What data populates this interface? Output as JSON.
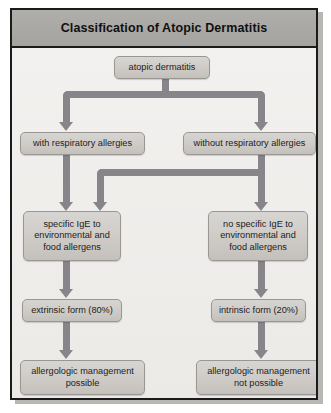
{
  "figure": {
    "title": "Classification of Atopic Dermatitis",
    "colors": {
      "frame_border": "#1b1b1b",
      "titlebar": "#a5a3a0",
      "canvas": "#f0efed",
      "node_fill": "#cecbc7",
      "node_border": "#9a9793",
      "connector": "#87858a"
    }
  },
  "diagram": {
    "type": "flowchart",
    "orientation": "top-down",
    "nodes": [
      {
        "id": "root",
        "label": "atopic dermatitis"
      },
      {
        "id": "with_resp",
        "label": "with respiratory allergies"
      },
      {
        "id": "without_resp",
        "label": "without respiratory allergies"
      },
      {
        "id": "ige_pos",
        "label": "specific IgE to environmental and food allergens"
      },
      {
        "id": "ige_neg",
        "label": "no specific IgE to environmental and food allergens"
      },
      {
        "id": "extrinsic",
        "label": "extrinsic form (80%)"
      },
      {
        "id": "intrinsic",
        "label": "intrinsic form (20%)"
      },
      {
        "id": "mgmt_yes",
        "label": "allergologic management possible"
      },
      {
        "id": "mgmt_no",
        "label": "allergologic management not possible"
      }
    ],
    "node_lines": {
      "root": [
        "atopic dermatitis"
      ],
      "with_resp": [
        "with respiratory allergies"
      ],
      "without_resp": [
        "without respiratory allergies"
      ],
      "ige_pos_1": "specific IgE to",
      "ige_pos_2": "environmental and",
      "ige_pos_3": "food allergens",
      "ige_neg_1": "no specific IgE to",
      "ige_neg_2": "environmental and",
      "ige_neg_3": "food allergens",
      "extrinsic": "extrinsic form (80%)",
      "intrinsic": "intrinsic form (20%)",
      "mgmt_yes_1": "allergologic management",
      "mgmt_yes_2": "possible",
      "mgmt_no_1": "allergologic management",
      "mgmt_no_2": "not possible"
    },
    "edges": [
      {
        "from": "root",
        "to": "with_resp"
      },
      {
        "from": "root",
        "to": "without_resp"
      },
      {
        "from": "with_resp",
        "to": "ige_pos"
      },
      {
        "from": "without_resp",
        "to": "ige_pos"
      },
      {
        "from": "without_resp",
        "to": "ige_neg"
      },
      {
        "from": "ige_pos",
        "to": "extrinsic"
      },
      {
        "from": "ige_neg",
        "to": "intrinsic"
      },
      {
        "from": "extrinsic",
        "to": "mgmt_yes"
      },
      {
        "from": "intrinsic",
        "to": "mgmt_no"
      }
    ]
  }
}
